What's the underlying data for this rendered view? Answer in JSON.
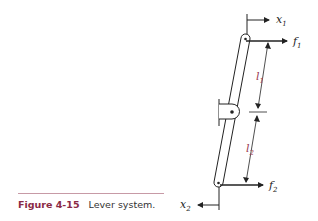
{
  "caption": {
    "figure_number": "Figure 4-15",
    "title": "Lever system."
  },
  "labels": {
    "x1": {
      "base": "x",
      "sub": "1"
    },
    "x2": {
      "base": "x",
      "sub": "2"
    },
    "f1": {
      "base": "f",
      "sub": "1"
    },
    "f2": {
      "base": "f",
      "sub": "2"
    },
    "l1": {
      "base": "l",
      "sub": "1"
    },
    "l2": {
      "base": "l",
      "sub": "2"
    }
  },
  "colors": {
    "line": "#222222",
    "accent_label": "#9a3b52",
    "figure_number": "#8a2a45",
    "rule": "#c79aa6"
  }
}
